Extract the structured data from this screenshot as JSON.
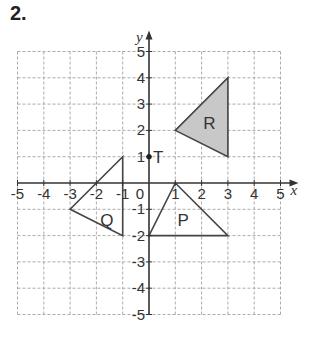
{
  "question_number": "2.",
  "grid": {
    "xmin": -5,
    "xmax": 5,
    "ymin": -5,
    "ymax": 5
  },
  "axes": {
    "x_label": "x",
    "y_label": "y",
    "origin_label": "0",
    "x_ticks": [
      "-5",
      "-4",
      "-3",
      "-2",
      "-1",
      "1",
      "2",
      "3",
      "4",
      "5"
    ],
    "y_ticks": [
      "5",
      "4",
      "3",
      "2",
      "1",
      "-1",
      "-2",
      "-3",
      "-4",
      "-5"
    ]
  },
  "shapes": [
    {
      "name": "R",
      "points": [
        [
          1,
          2
        ],
        [
          3,
          4
        ],
        [
          3,
          1
        ]
      ],
      "fill": "#c8c8c8",
      "label_at": [
        2.3,
        2.3
      ]
    },
    {
      "name": "Q",
      "points": [
        [
          -1,
          1
        ],
        [
          -3,
          -1
        ],
        [
          -1,
          -2
        ]
      ],
      "fill": "none",
      "label_at": [
        -1.6,
        -1.4
      ]
    },
    {
      "name": "P",
      "points": [
        [
          1,
          0
        ],
        [
          0,
          -2
        ],
        [
          3,
          -2
        ]
      ],
      "fill": "none",
      "label_at": [
        1.3,
        -1.4
      ]
    }
  ],
  "point": {
    "name": "T",
    "at": [
      0,
      1
    ]
  }
}
